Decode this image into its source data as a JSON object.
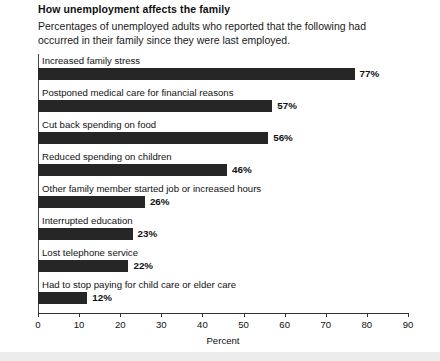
{
  "chart_data": {
    "type": "bar",
    "orientation": "horizontal",
    "title": "How unemployment affects the family",
    "subtitle": "Percentages of unemployed adults who reported that the following had occurred in their family since they were last employed.",
    "xlabel": "Percent",
    "ylabel": "",
    "xlim": [
      0,
      90
    ],
    "xticks": [
      0,
      10,
      20,
      30,
      40,
      50,
      60,
      70,
      80,
      90
    ],
    "xtick_labels": [
      "0",
      "10",
      "20",
      "30",
      "40",
      "50",
      "60",
      "70",
      "80",
      "90"
    ],
    "grid": false,
    "legend": false,
    "bar_color": "#262626",
    "categories": [
      "Increased family stress",
      "Postponed medical care for financial reasons",
      "Cut back spending on food",
      "Reduced spending on children",
      "Other family member started job or increased hours",
      "Interrupted education",
      "Lost telephone service",
      "Had to stop paying for child care or elder care"
    ],
    "values": [
      77,
      57,
      56,
      46,
      26,
      23,
      22,
      12
    ],
    "value_labels": [
      "77%",
      "57%",
      "56%",
      "46%",
      "26%",
      "23%",
      "22%",
      "12%"
    ]
  }
}
